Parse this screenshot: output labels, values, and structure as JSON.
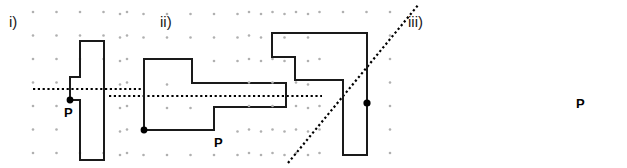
{
  "worksheet": {
    "width": 627,
    "height": 168,
    "background_color": "#ffffff",
    "description": "Three grid figures showing shapes with a point P and a dotted line of reflection"
  },
  "style": {
    "grid_dot_color": "#b0b0b0",
    "shape_stroke_color": "#1a1a1a",
    "mirror_line_color": "#000000",
    "point_color": "#000000",
    "grid_spacing": 23.5
  },
  "panels": [
    {
      "id": "i",
      "label": "i)",
      "label_position": {
        "x": 9,
        "y": 14
      },
      "grid": {
        "origin": {
          "x": 33,
          "y": 12
        },
        "spacing": 23.5,
        "cols": 5,
        "rows": 7
      },
      "mirror_line": {
        "orientation": "horizontal",
        "style": "dotted",
        "x1": 33,
        "y1": 89,
        "x2": 145,
        "y2": 89
      },
      "shape": {
        "kind": "polygon",
        "points": "80,41 104,41 104,160 80,160 80,100 70,100 70,89 70,77 80,77 80,41",
        "outline_points": [
          [
            80,
            41
          ],
          [
            104,
            41
          ],
          [
            104,
            160
          ],
          [
            80,
            160
          ],
          [
            80,
            100
          ],
          [
            70,
            100
          ],
          [
            70,
            77
          ],
          [
            80,
            77
          ]
        ]
      },
      "point": {
        "name": "P",
        "label": "P",
        "x": 70,
        "y": 100,
        "label_position": {
          "x": 64,
          "y": 106
        }
      }
    },
    {
      "id": "ii",
      "label": "ii)",
      "label_position": {
        "x": 160,
        "y": 14
      },
      "grid": {
        "origin": {
          "x": 196,
          "y": 12
        },
        "spacing": 23.5,
        "cols": 9,
        "rows": 7
      },
      "mirror_line": {
        "orientation": "horizontal",
        "style": "dotted",
        "x1": 185,
        "y1": 96,
        "x2": 398,
        "y2": 96
      },
      "shape": {
        "kind": "polygon",
        "outline_points": [
          [
            220,
            130
          ],
          [
            220,
            59
          ],
          [
            268,
            59
          ],
          [
            268,
            83
          ],
          [
            362,
            83
          ],
          [
            362,
            107
          ],
          [
            290,
            107
          ],
          [
            290,
            130
          ]
        ]
      },
      "point": {
        "name": "P",
        "label": "P",
        "x": 220,
        "y": 130,
        "label_position": {
          "x": 214,
          "y": 136
        }
      }
    },
    {
      "id": "iii",
      "label": "iii)",
      "label_position": {
        "x": 408,
        "y": 14
      },
      "grid": {
        "origin": {
          "x": 450,
          "y": 12
        },
        "spacing": 23.5,
        "cols": 7,
        "rows": 7
      },
      "mirror_line": {
        "orientation": "diagonal",
        "style": "dotted",
        "x1": 489,
        "y1": 163,
        "x2": 620,
        "y2": 4
      },
      "shape": {
        "kind": "polygon",
        "outline_points": [
          [
            473,
            33
          ],
          [
            568,
            33
          ],
          [
            568,
            155
          ],
          [
            544,
            155
          ],
          [
            544,
            80
          ],
          [
            496,
            80
          ],
          [
            496,
            57
          ],
          [
            473,
            57
          ]
        ]
      },
      "point": {
        "name": "P",
        "label": "P",
        "x": 568,
        "y": 103,
        "label_position": {
          "x": 576,
          "y": 97
        }
      }
    }
  ]
}
